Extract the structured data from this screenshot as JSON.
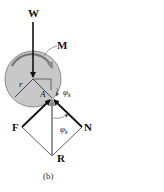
{
  "figure": {
    "caption": "(b)",
    "labels": {
      "weight": "W",
      "moment": "M",
      "radius": "r",
      "contact_point": "A",
      "friction_force": "F",
      "normal_force": "N",
      "resultant": "R",
      "angle_symbol": "φ",
      "angle_subscript": "k"
    },
    "colors": {
      "wheel_fill": "#c8c8c8",
      "wheel_stroke": "#8a8a8a",
      "force_arrow": "#111111",
      "resultant_arrow": "#8a8a8a",
      "construction_line": "#333333"
    }
  }
}
